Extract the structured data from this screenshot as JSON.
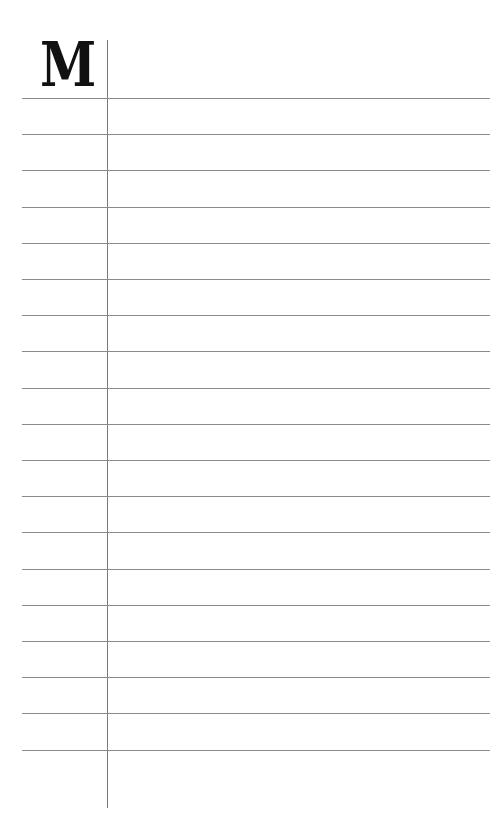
{
  "page": {
    "type": "lined-notebook-page",
    "initial_letter": "M",
    "line_count": 19,
    "first_line_y": 98,
    "line_spacing": 36.2,
    "line_color": "#8a8a8a",
    "margin_line_color": "#777777",
    "background": "#ffffff"
  }
}
